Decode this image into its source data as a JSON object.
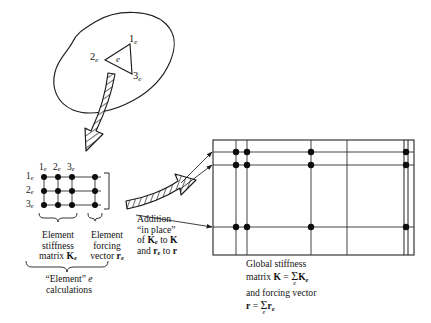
{
  "figure": {
    "domain_blob": {
      "name": "continuum-domain",
      "element_label": "e",
      "node_labels": [
        "1",
        "2",
        "3"
      ],
      "node_subscript": "e"
    },
    "element_matrix": {
      "column_headers": [
        "1",
        "2",
        "3"
      ],
      "row_headers": [
        "1",
        "2",
        "3"
      ],
      "header_subscript": "e",
      "rows": 3,
      "cols": 3,
      "vector_cols": 1,
      "stiffness_caption_lines": [
        "Element",
        "stiffness",
        "matrix"
      ],
      "stiffness_symbol": "K",
      "stiffness_symbol_sub": "e",
      "forcing_caption_lines": [
        "Element",
        "forcing",
        "vector"
      ],
      "forcing_symbol": "r",
      "forcing_symbol_sub": "e",
      "group_caption_line1_pre": "“Element” ",
      "group_caption_line1_italic": "e",
      "group_caption_line2": "calculations"
    },
    "addition_arrow": {
      "line1": "Addition",
      "line2": "“in place”",
      "line3_pre": "of ",
      "line3_sym1": "K",
      "line3_sym1_sub": "e",
      "line3_mid": " to ",
      "line3_sym2": "K",
      "line4_pre": "and ",
      "line4_sym1": "r",
      "line4_sym1_sub": "e",
      "line4_mid": " to ",
      "line4_sym2": "r"
    },
    "global_matrix": {
      "caption_line1": "Global stiffness",
      "caption_line2_pre": "matrix ",
      "caption_line2_sym": "K",
      "caption_line2_eq": " = ",
      "caption_line2_sigma": "Σ",
      "caption_line2_sigma_sub": "e",
      "caption_line2_term": "K",
      "caption_line2_term_sub": "e",
      "caption_line3": "and forcing vector",
      "caption_line4_sym": "r",
      "caption_line4_eq": " = ",
      "caption_line4_sigma": "Σ",
      "caption_line4_sigma_sub": "e",
      "caption_line4_term": "r",
      "caption_line4_term_sub": "e"
    },
    "colors": {
      "ink": "#141414",
      "line": "#2a2a2a",
      "background": "#ffffff",
      "hatch": "#1a1a1a"
    }
  }
}
